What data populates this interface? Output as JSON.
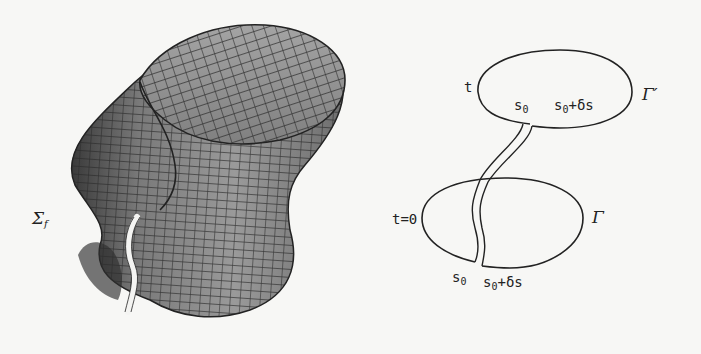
{
  "figure": {
    "left_panel": {
      "surface_label": "Σ",
      "surface_label_sub": "f",
      "description": "3D mesh surface swept by a closed curve, with a narrow slit"
    },
    "right_panel": {
      "upper_curve": {
        "name": "Γ′",
        "time_label": "t",
        "point_a": "s",
        "point_a_sub": "0",
        "point_b_prefix": "s",
        "point_b_sub": "0",
        "point_b_suffix": "+δs"
      },
      "lower_curve": {
        "name": "Γ",
        "time_label": "t=0",
        "point_a": "s",
        "point_a_sub": "0",
        "point_b_prefix": "s",
        "point_b_sub": "0",
        "point_b_suffix": "+δs"
      }
    },
    "colors": {
      "background": "#f7f7f5",
      "mesh_fill": "#8e8e8e",
      "mesh_lines": "#2a2a2a",
      "ink": "#222222"
    }
  }
}
